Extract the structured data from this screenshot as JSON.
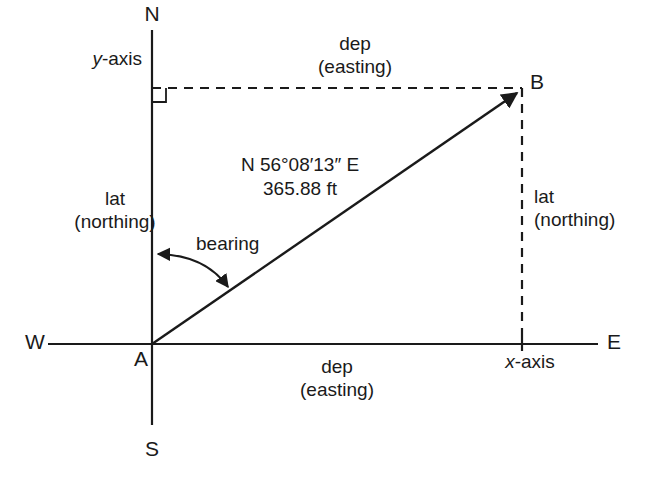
{
  "diagram": {
    "compass": {
      "north": "N",
      "south": "S",
      "east": "E",
      "west": "W"
    },
    "axes": {
      "y_axis_label_prefix": "y",
      "y_axis_label_suffix": "-axis",
      "x_axis_label_prefix": "x",
      "x_axis_label_suffix": "-axis"
    },
    "points": {
      "origin": "A",
      "terminus": "B"
    },
    "course": {
      "bearing": "N 56°08′13″ E",
      "distance": "365.88 ft",
      "bearing_label": "bearing"
    },
    "components": {
      "dep_top": "dep",
      "dep_top_sub": "(easting)",
      "dep_bottom": "dep",
      "dep_bottom_sub": "(easting)",
      "lat_left": "lat",
      "lat_left_sub": "(northing)",
      "lat_right": "lat",
      "lat_right_sub": "(northing)"
    },
    "colors": {
      "ink": "#1a1a1a",
      "background": "#ffffff"
    }
  }
}
